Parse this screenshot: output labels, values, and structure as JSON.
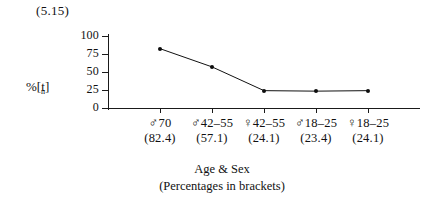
{
  "figure": {
    "number": "(5.15)"
  },
  "axes": {
    "y_title_main": "%[t",
    "y_title_sub": "n",
    "y_title_close": "]",
    "y_ticks": [
      "100",
      "75",
      "50",
      "25",
      "0"
    ],
    "x_caption_line1": "Age & Sex",
    "x_caption_line2": "(Percentages in brackets)"
  },
  "groups": [
    {
      "sex": "♂",
      "age": "70",
      "percent": "(82.4)"
    },
    {
      "sex": "♂",
      "age": "42–55",
      "percent": "(57.1)"
    },
    {
      "sex": "♀",
      "age": "42–55",
      "percent": "(24.1)"
    },
    {
      "sex": "♂",
      "age": "18–25",
      "percent": "(23.4)"
    },
    {
      "sex": "♀",
      "age": "18–25",
      "percent": "(24.1)"
    }
  ],
  "chart_data": {
    "type": "line",
    "title": "(5.15)",
    "xlabel": "Age & Sex (Percentages in brackets)",
    "ylabel": "%[t̩]",
    "categories": [
      "♂ 70",
      "♂ 42–55",
      "♀ 42–55",
      "♂ 18–25",
      "♀ 18–25"
    ],
    "values": [
      82.4,
      57.1,
      24.1,
      23.4,
      24.1
    ],
    "point_labels": [
      "(82.4)",
      "(57.1)",
      "(24.1)",
      "(23.4)",
      "(24.1)"
    ],
    "ylim": [
      0,
      100
    ],
    "yticks": [
      0,
      25,
      50,
      75,
      100
    ],
    "grid": false,
    "legend": false,
    "marker": "filled-circle",
    "line_color": "#111111"
  }
}
